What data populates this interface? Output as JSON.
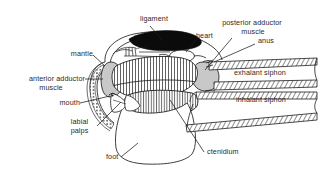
{
  "figure": {
    "background_color": "#ffffff",
    "line_color": "#1a1a1a",
    "text_color": "#2a2a2a",
    "fill_gray": "#c8c8c8",
    "fill_black": "#0a0a0a"
  },
  "labels": {
    "ligament": "ligament",
    "heart": "heart",
    "posterior_adductor": "posterior adductor",
    "muscle_1": "muscle",
    "anus": "anus",
    "mantle": "mantle",
    "exhalant_siphon": "exhalant siphon",
    "inhalant_siphon": "inhalant siphon",
    "anterior_adductor": "anterior adductor",
    "muscle_2": "muscle",
    "mouth": "mouth",
    "labial": "labial",
    "palps": "palps",
    "foot": "foot",
    "ctenidium": "ctenidium"
  },
  "structures": [
    {
      "name": "ligament",
      "style": "solid-black-crescent"
    },
    {
      "name": "heart",
      "style": "white-oval-outline"
    },
    {
      "name": "posterior-adductor-muscle",
      "style": "gray-oval"
    },
    {
      "name": "anterior-adductor-muscle",
      "style": "gray-oval"
    },
    {
      "name": "ctenidium-upper",
      "style": "vertical-hatch"
    },
    {
      "name": "ctenidium-lower",
      "style": "vertical-hatch"
    },
    {
      "name": "exhalant-siphon",
      "style": "cross-hatched-tube"
    },
    {
      "name": "inhalant-siphon",
      "style": "cross-hatched-tube"
    },
    {
      "name": "mantle",
      "style": "beaded-margin-outline"
    },
    {
      "name": "foot",
      "style": "plain-outline"
    },
    {
      "name": "labial-palps",
      "style": "plain-outline"
    },
    {
      "name": "shell",
      "style": "plain-outline"
    }
  ]
}
